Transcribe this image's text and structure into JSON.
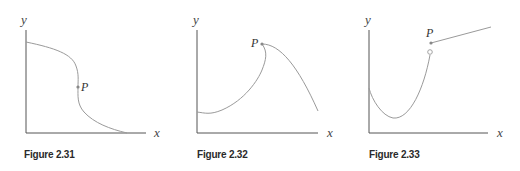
{
  "figures": [
    {
      "caption": "Figure 2.31",
      "x_label": "x",
      "y_label": "y",
      "point_label": "P",
      "description": "Decreasing curve with vertical tangent at P"
    },
    {
      "caption": "Figure 2.32",
      "x_label": "x",
      "y_label": "y",
      "point_label": "P",
      "description": "Curve with a corner (cusp-like peak) at P"
    },
    {
      "caption": "Figure 2.33",
      "x_label": "x",
      "y_label": "y",
      "point_label": "P",
      "description": "Jump discontinuity at P: curve ends at open circle, line starts at filled point P"
    }
  ],
  "colors": {
    "axis": "#555555",
    "curve": "#9a9a9a",
    "text": "#333333"
  }
}
